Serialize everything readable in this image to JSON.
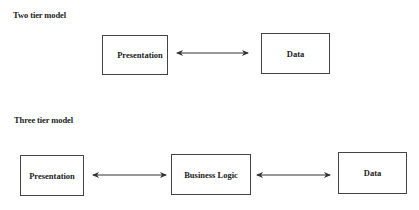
{
  "two_tier": {
    "title": "Two tier model",
    "boxes": [
      {
        "label": "Presentation"
      },
      {
        "label": "Data"
      }
    ],
    "connections": [
      {
        "from": "Presentation",
        "to": "Data",
        "type": "bidirectional-arrow"
      }
    ]
  },
  "three_tier": {
    "title": "Three tier model",
    "boxes": [
      {
        "label": "Presentation"
      },
      {
        "label": "Business Logic"
      },
      {
        "label": "Data"
      }
    ],
    "connections": [
      {
        "from": "Presentation",
        "to": "Business Logic",
        "type": "bidirectional-arrow"
      },
      {
        "from": "Business Logic",
        "to": "Data",
        "type": "bidirectional-arrow"
      }
    ]
  },
  "colors": {
    "line": "#333333",
    "text": "#222222",
    "background": "#ffffff"
  }
}
